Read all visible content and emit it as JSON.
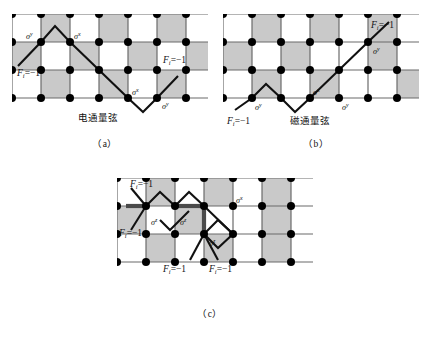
{
  "figure": {
    "background": "#ffffff",
    "cell_fill": "#c9c9c9",
    "line_color": "#6b6b6b",
    "path_color": "#111111",
    "node_color": "#000000"
  },
  "captions": {
    "a": "（a）",
    "b": "（b）",
    "c": "（c）"
  },
  "panels": [
    {
      "id": "a",
      "inner_caption": "电通量弦",
      "operator_labels": [
        {
          "key": "sigma_y_left",
          "base": "σ",
          "sup": "y"
        },
        {
          "key": "sigma_x_mid",
          "base": "σ",
          "sup": "x"
        },
        {
          "key": "sigma_x_right",
          "base": "σ",
          "sup": "x"
        },
        {
          "key": "sigma_y_right",
          "base": "σ",
          "sup": "y"
        }
      ],
      "excitations": [
        {
          "key": "f-left",
          "text": "F",
          "sub": "i",
          "value": "=−1"
        },
        {
          "key": "f-right",
          "text": "F",
          "sub": "i",
          "value": "=−1"
        }
      ]
    },
    {
      "id": "b",
      "inner_caption": "磁通量弦",
      "operator_labels": [
        {
          "key": "sigma_y_left",
          "base": "σ",
          "sup": "y"
        },
        {
          "key": "sigma_x_mid",
          "base": "σ",
          "sup": "x"
        },
        {
          "key": "sigma_y_mid",
          "base": "σ",
          "sup": "y"
        },
        {
          "key": "sigma_y_upper",
          "base": "σ",
          "sup": "y"
        }
      ],
      "excitations": [
        {
          "key": "f-lower-left",
          "text": "F",
          "sub": "i",
          "value": "=−1"
        },
        {
          "key": "f-upper-right",
          "text": "F",
          "sub": "i",
          "value": "=−1"
        }
      ]
    },
    {
      "id": "c",
      "inner_caption": "",
      "operator_labels": [
        {
          "key": "sigma_z_left",
          "base": "σ",
          "sup": "z"
        },
        {
          "key": "sigma_z_mid",
          "base": "σ",
          "sup": "z"
        },
        {
          "key": "sigma_x_right",
          "base": "σ",
          "sup": "x"
        },
        {
          "key": "sigma_z_bottom",
          "base": "σ",
          "sup": "z"
        }
      ],
      "excitations": [
        {
          "key": "f-top-left",
          "text": "F",
          "sub": "i",
          "value": "=−1"
        },
        {
          "key": "f-mid-left",
          "text": "F",
          "sub": "i",
          "value": "=−1"
        },
        {
          "key": "f-bottom-left",
          "text": "F",
          "sub": "i",
          "value": "=−1"
        },
        {
          "key": "f-bottom-right",
          "text": "F",
          "sub": "i",
          "value": "=−1"
        }
      ]
    }
  ]
}
